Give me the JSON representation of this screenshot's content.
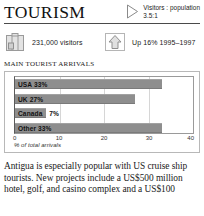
{
  "header": {
    "title": "TOURISM",
    "triangle_icon": "triangle-right-icon",
    "ratio_label": "Visitors : population",
    "ratio_value": "3.5:1"
  },
  "stats": [
    {
      "icon": "suitcase-icon",
      "label": "231,000 visitors"
    },
    {
      "icon": "up-arrow-icon",
      "label": "Up 16%  1995–1997"
    }
  ],
  "section": {
    "title": "MAIN TOURIST ARRIVALS"
  },
  "chart_data": {
    "type": "bar",
    "orientation": "horizontal",
    "title": "MAIN TOURIST ARRIVALS",
    "xlabel": "% of total arrivals",
    "ylabel": "",
    "categories": [
      "USA",
      "UK",
      "Canada",
      "Other"
    ],
    "values": [
      33,
      27,
      7,
      33
    ],
    "bar_labels": [
      "USA 33%",
      "UK 27%",
      "Canada 7%",
      "Other  33%"
    ],
    "label_placement": [
      "inside",
      "inside",
      "split",
      "inside"
    ],
    "xlim": [
      0,
      40
    ],
    "xticks": [
      0,
      10,
      20,
      30,
      40
    ],
    "xtick_labels": [
      "0",
      "10",
      "20",
      "30",
      "40"
    ],
    "grid": true,
    "legend": false,
    "bar_color": "#8e8e8e"
  },
  "body": {
    "paragraph": "Antigua is especially popular with US cruise ship tourists. New projects include a US$500 million hotel, golf, and casino complex and a US$100"
  }
}
